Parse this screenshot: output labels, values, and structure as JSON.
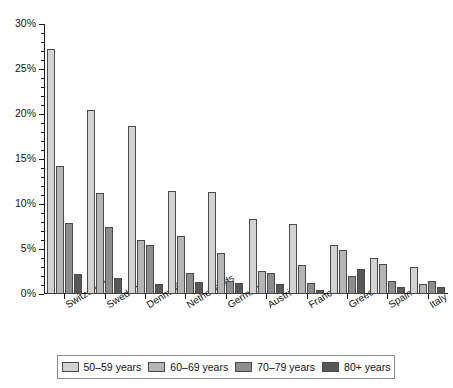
{
  "chart_data": {
    "type": "bar",
    "title": "",
    "subtitle": "",
    "xlabel": "",
    "ylabel": "",
    "ylim": [
      0,
      30
    ],
    "ytick_labels": [
      "0%",
      "5%",
      "10%",
      "15%",
      "20%",
      "25%",
      "30%"
    ],
    "ytick_values": [
      0,
      5,
      10,
      15,
      20,
      25,
      30
    ],
    "yminor_step": 1,
    "grid": false,
    "legend_position": "bottom",
    "value_unit": "%",
    "categories": [
      "Switzerland",
      "Sweden",
      "Denmark",
      "Netherlands",
      "Germany",
      "Austria",
      "France",
      "Greece",
      "Spain",
      "Italy"
    ],
    "series": [
      {
        "name": "50–59 years",
        "color": "#d2d2d2",
        "values": [
          27.2,
          20.5,
          18.7,
          11.4,
          11.3,
          8.3,
          7.8,
          5.5,
          4.0,
          3.0
        ]
      },
      {
        "name": "60–69 years",
        "color": "#b5b5b5",
        "values": [
          14.2,
          11.2,
          6.0,
          6.4,
          4.6,
          2.6,
          3.2,
          4.9,
          3.3,
          1.1
        ]
      },
      {
        "name": "70–79 years",
        "color": "#8d8d8d",
        "values": [
          7.9,
          7.5,
          5.4,
          2.3,
          1.4,
          2.3,
          1.2,
          2.0,
          1.5,
          1.4
        ]
      },
      {
        "name": "80+ years",
        "color": "#585858",
        "values": [
          2.2,
          1.8,
          1.1,
          1.3,
          1.2,
          1.1,
          0.5,
          2.8,
          0.8,
          0.8
        ]
      }
    ]
  }
}
